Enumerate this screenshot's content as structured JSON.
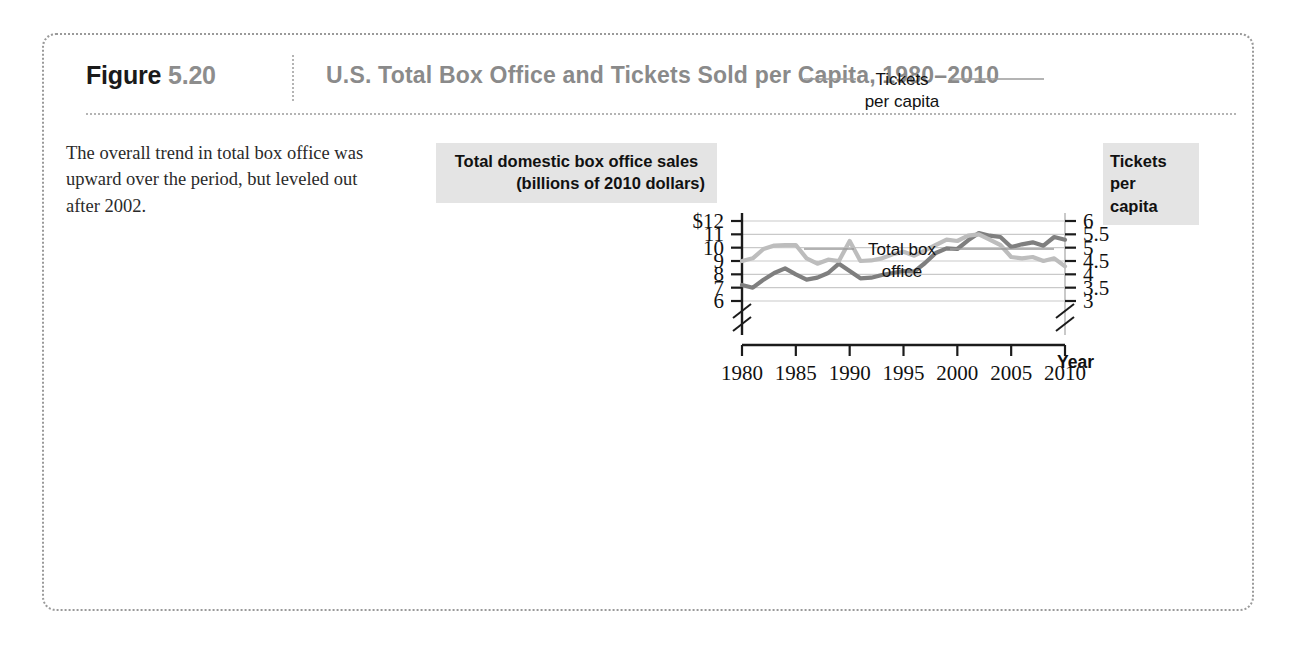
{
  "figure": {
    "label_prefix": "Figure",
    "label_number": "5.20",
    "title": "U.S. Total Box Office and Tickets Sold per Capita, 1980–2010",
    "caption": "The overall trend in total box office was upward over the period, but leveled out after 2002."
  },
  "left_axis_title": {
    "line1": "Total domestic box office sales",
    "line2": "(billions of 2010 dollars)"
  },
  "right_axis_title": {
    "line1": "Tickets per",
    "line2": "capita"
  },
  "colors": {
    "box_office_line": "#7f7f7f",
    "tickets_line": "#bdbdbd",
    "grid": "#c9c9c9",
    "axis": "#1b1b1b",
    "header_gray": "#8a8a8a",
    "title_band": "#e4e4e4"
  },
  "chart_data": {
    "type": "line",
    "title": "U.S. Total Box Office and Tickets Sold per Capita, 1980–2010",
    "xlabel": "Year",
    "ylabel": "Total domestic box office sales (billions of 2010 dollars)",
    "y2label": "Tickets per capita",
    "xlim": [
      1980,
      2010
    ],
    "ylim": [
      6,
      12
    ],
    "y2lim": [
      3,
      6
    ],
    "grid": true,
    "axis_break_left": true,
    "axis_break_right": true,
    "legend_position": "inline-annotation",
    "x_ticks": [
      "1980",
      "1985",
      "1990",
      "1995",
      "2000",
      "2005",
      "2010"
    ],
    "y_ticks_left": [
      "$12",
      "11",
      "10",
      "9",
      "8",
      "7",
      "6"
    ],
    "y_ticks_right": [
      "6",
      "5.5",
      "5",
      "4.5",
      "4",
      "3.5",
      "3"
    ],
    "x": [
      1980,
      1981,
      1982,
      1983,
      1984,
      1985,
      1986,
      1987,
      1988,
      1989,
      1990,
      1991,
      1992,
      1993,
      1994,
      1995,
      1996,
      1997,
      1998,
      1999,
      2000,
      2001,
      2002,
      2003,
      2004,
      2005,
      2006,
      2007,
      2008,
      2009,
      2010
    ],
    "series": [
      {
        "name": "Total box office",
        "axis": "left",
        "units": "billions of 2010 dollars",
        "color": "#7f7f7f",
        "annotation": "Total box\noffice",
        "values": [
          7.2,
          7.0,
          7.6,
          8.1,
          8.45,
          8.0,
          7.6,
          7.75,
          8.1,
          8.8,
          8.25,
          7.7,
          7.75,
          7.95,
          8.1,
          8.25,
          8.2,
          8.85,
          9.6,
          9.95,
          9.9,
          10.55,
          11.1,
          10.9,
          10.8,
          10.05,
          10.25,
          10.4,
          10.15,
          10.8,
          10.6
        ]
      },
      {
        "name": "Tickets per capita",
        "axis": "right",
        "units": "tickets per person per year",
        "color": "#bdbdbd",
        "annotation": "Tickets\nper capita",
        "values": [
          4.5,
          4.6,
          4.95,
          5.08,
          5.1,
          5.1,
          4.6,
          4.4,
          4.55,
          4.5,
          5.25,
          4.5,
          4.52,
          4.6,
          4.75,
          4.85,
          4.7,
          4.9,
          5.1,
          5.3,
          5.25,
          5.45,
          5.5,
          5.3,
          5.1,
          4.65,
          4.6,
          4.65,
          4.5,
          4.6,
          4.3
        ]
      }
    ]
  }
}
